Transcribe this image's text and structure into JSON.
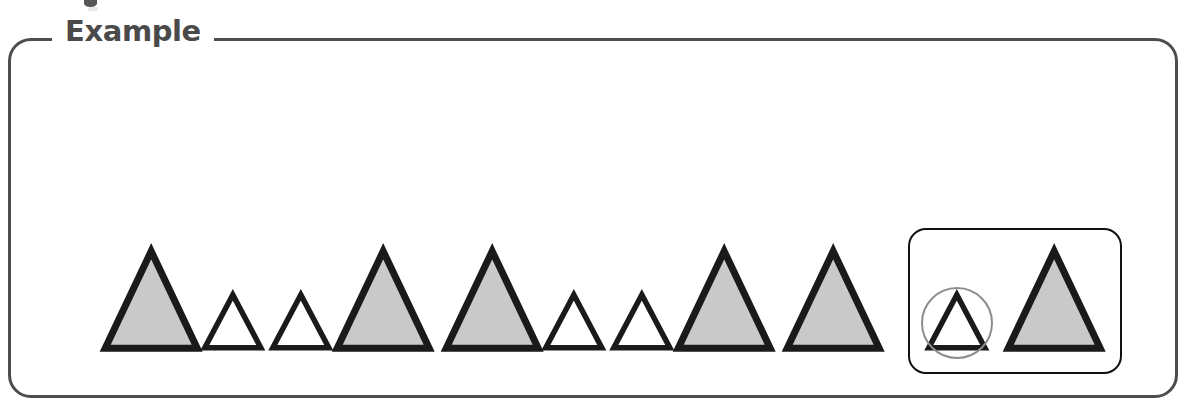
{
  "page": {
    "title": "Example",
    "background_color": "#ffffff",
    "width": 1186,
    "height": 418
  },
  "frame": {
    "legend_label": "Example",
    "border_color": "#4d4d4d",
    "border_width": 3,
    "corner_radius": 23
  },
  "colors": {
    "shape_outline": "#1a1a1a",
    "shape_fill_large": "#c9c9c9",
    "shape_fill_small": "#ffffff",
    "answer_box_border": "#111111",
    "highlight_circle": "#8d8d8d",
    "legend_text": "#4a4a4a"
  },
  "sequence": {
    "description": "repeating pattern of triangles",
    "baseline_y": 348,
    "pattern_code": "L S S L L S S L L",
    "items": [
      {
        "index": 1,
        "size": "large",
        "fill": "gray",
        "label": "large gray triangle",
        "cx": 151,
        "base_width": 92,
        "height": 97
      },
      {
        "index": 2,
        "size": "small",
        "fill": "white",
        "label": "small white triangle",
        "cx": 233,
        "base_width": 56,
        "height": 53
      },
      {
        "index": 3,
        "size": "small",
        "fill": "white",
        "label": "small white triangle",
        "cx": 301,
        "base_width": 56,
        "height": 53
      },
      {
        "index": 4,
        "size": "large",
        "fill": "gray",
        "label": "large gray triangle",
        "cx": 383,
        "base_width": 92,
        "height": 97
      },
      {
        "index": 5,
        "size": "large",
        "fill": "gray",
        "label": "large gray triangle",
        "cx": 492,
        "base_width": 92,
        "height": 97
      },
      {
        "index": 6,
        "size": "small",
        "fill": "white",
        "label": "small white triangle",
        "cx": 574,
        "base_width": 56,
        "height": 53
      },
      {
        "index": 7,
        "size": "small",
        "fill": "white",
        "label": "small white triangle",
        "cx": 642,
        "base_width": 56,
        "height": 53
      },
      {
        "index": 8,
        "size": "large",
        "fill": "gray",
        "label": "large gray triangle",
        "cx": 724,
        "base_width": 92,
        "height": 97
      },
      {
        "index": 9,
        "size": "large",
        "fill": "gray",
        "label": "large gray triangle",
        "cx": 833,
        "base_width": 92,
        "height": 97
      }
    ]
  },
  "answer_box": {
    "label": "answer choice group",
    "x": 908,
    "y": 228,
    "width": 214,
    "height": 146,
    "options": [
      {
        "index": 1,
        "size": "small",
        "fill": "white",
        "label": "small white triangle",
        "selected": true,
        "highlight": "circle",
        "cx": 957,
        "base_width": 56,
        "height": 53,
        "baseline_y": 348
      },
      {
        "index": 2,
        "size": "large",
        "fill": "gray",
        "label": "large gray triangle",
        "selected": false,
        "highlight": "none",
        "cx": 1054,
        "base_width": 92,
        "height": 97,
        "baseline_y": 348
      }
    ]
  }
}
